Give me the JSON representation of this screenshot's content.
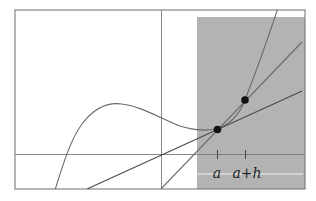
{
  "figure": {
    "colors": {
      "background": "#ffffff",
      "frame": "#6e6e6e",
      "axis": "#7a7a7a",
      "shade": "#b3b3b3",
      "curve": "#6a6a6a",
      "tangent": "#4a4a4a",
      "secant": "#6a6a6a",
      "point": "#111111",
      "highlight_line": "#f2f2f2",
      "label": "#1e1e1e"
    },
    "shaded_region": {
      "label": "zoom-region"
    },
    "points": [
      {
        "name": "point-a",
        "label": "a"
      },
      {
        "name": "point-a-plus-h",
        "label": "a+h"
      }
    ],
    "tick_labels": {
      "a": "a",
      "a_plus_h": "a+h"
    },
    "lines": {
      "curve": "f(x)",
      "tangent": "tangent at a",
      "secant": "secant through a and a+h"
    }
  }
}
